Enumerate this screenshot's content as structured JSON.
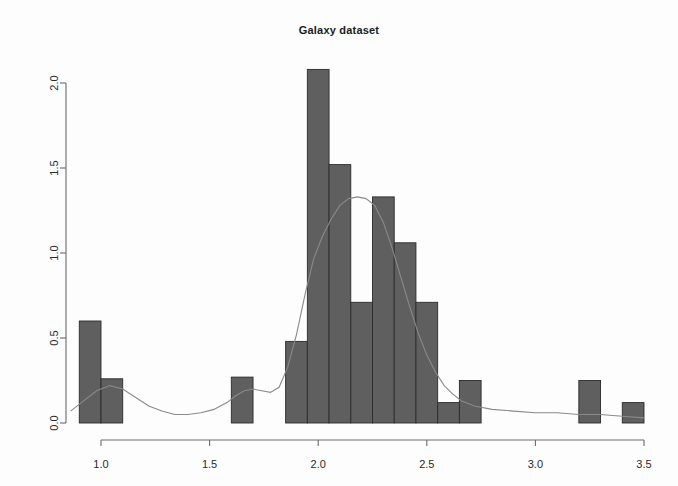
{
  "chart_data": {
    "type": "bar",
    "title": "Galaxy dataset",
    "subtitle": "",
    "xlabel": "",
    "ylabel": "",
    "xlim": [
      0.85,
      3.55
    ],
    "ylim": [
      0.0,
      2.2
    ],
    "grid": false,
    "legend": null,
    "xticks": [
      "1.0",
      "1.5",
      "2.0",
      "2.5",
      "3.0",
      "3.5"
    ],
    "xtick_values": [
      1.0,
      1.5,
      2.0,
      2.5,
      3.0,
      3.5
    ],
    "yticks": [
      "0.0",
      "0.5",
      "1.0",
      "1.5",
      "2.0"
    ],
    "ytick_values": [
      0.0,
      0.5,
      1.0,
      1.5,
      2.0
    ],
    "bar_color": "#5f5f5f",
    "bar_edge_color": "#2b2b2b",
    "curve_color": "#8a8a8a",
    "axis_color": "#6b6b6b",
    "bins": [
      {
        "x0": 0.9,
        "x1": 1.0,
        "value": 0.6
      },
      {
        "x0": 1.0,
        "x1": 1.1,
        "value": 0.26
      },
      {
        "x0": 1.6,
        "x1": 1.7,
        "value": 0.27
      },
      {
        "x0": 1.85,
        "x1": 1.95,
        "value": 0.48
      },
      {
        "x0": 1.95,
        "x1": 2.05,
        "value": 2.08
      },
      {
        "x0": 2.05,
        "x1": 2.15,
        "value": 1.52
      },
      {
        "x0": 2.15,
        "x1": 2.25,
        "value": 0.71
      },
      {
        "x0": 2.25,
        "x1": 2.35,
        "value": 1.33
      },
      {
        "x0": 2.35,
        "x1": 2.45,
        "value": 1.06
      },
      {
        "x0": 2.45,
        "x1": 2.55,
        "value": 0.71
      },
      {
        "x0": 2.55,
        "x1": 2.65,
        "value": 0.12
      },
      {
        "x0": 2.65,
        "x1": 2.75,
        "value": 0.25
      },
      {
        "x0": 3.2,
        "x1": 3.3,
        "value": 0.25
      },
      {
        "x0": 3.4,
        "x1": 3.5,
        "value": 0.12
      }
    ],
    "density_curve": {
      "name": "density estimate",
      "x": [
        0.86,
        0.92,
        0.98,
        1.04,
        1.1,
        1.16,
        1.22,
        1.28,
        1.34,
        1.4,
        1.46,
        1.52,
        1.58,
        1.62,
        1.66,
        1.7,
        1.74,
        1.78,
        1.82,
        1.86,
        1.9,
        1.94,
        1.98,
        2.02,
        2.06,
        2.1,
        2.14,
        2.18,
        2.22,
        2.26,
        2.3,
        2.34,
        2.38,
        2.42,
        2.46,
        2.5,
        2.54,
        2.58,
        2.62,
        2.66,
        2.72,
        2.8,
        2.9,
        3.0,
        3.1,
        3.2,
        3.3,
        3.4,
        3.5
      ],
      "y": [
        0.07,
        0.13,
        0.19,
        0.22,
        0.2,
        0.15,
        0.1,
        0.07,
        0.05,
        0.05,
        0.06,
        0.08,
        0.12,
        0.16,
        0.19,
        0.2,
        0.19,
        0.18,
        0.21,
        0.33,
        0.52,
        0.76,
        0.97,
        1.1,
        1.2,
        1.28,
        1.32,
        1.33,
        1.32,
        1.28,
        1.18,
        1.03,
        0.86,
        0.69,
        0.53,
        0.4,
        0.3,
        0.22,
        0.17,
        0.13,
        0.1,
        0.08,
        0.07,
        0.06,
        0.06,
        0.05,
        0.05,
        0.04,
        0.03
      ]
    }
  }
}
